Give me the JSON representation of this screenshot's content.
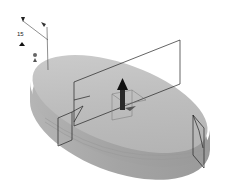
{
  "viewport": {
    "background": "#ffffff",
    "model": {
      "name": "elliptical-disk",
      "top_color": "#bdbdbd",
      "side_color": "#a8a8a8"
    },
    "annotations": {
      "dimension_label": "15"
    },
    "manipulator": {
      "arrow_color": "#1a1a1a"
    },
    "section_planes": 3,
    "handles": 4
  }
}
